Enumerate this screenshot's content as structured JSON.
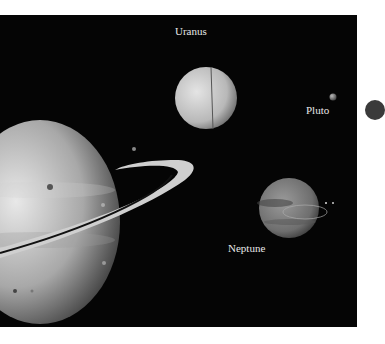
{
  "scene": {
    "title": "Outer planets illustration",
    "background_color": "#050505",
    "labels": [
      {
        "name": "Uranus"
      },
      {
        "name": "Pluto"
      },
      {
        "name": "Neptune"
      }
    ]
  }
}
